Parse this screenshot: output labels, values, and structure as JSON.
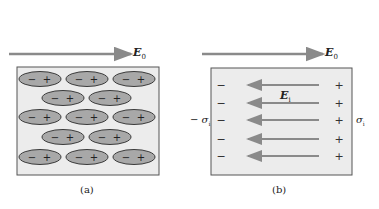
{
  "panel_a": {
    "caption": "(a)",
    "field_label": "E",
    "field_sub": "0",
    "dipole_neg": "−",
    "dipole_pos": "+",
    "rows": [
      3,
      2,
      3,
      2,
      3
    ]
  },
  "panel_b": {
    "caption": "(b)",
    "field_label": "E",
    "field_sub": "0",
    "internal_field_label": "E",
    "internal_field_sub": "i",
    "left_charge_label": "− σ",
    "left_charge_sub": "i",
    "right_charge_label": "σ",
    "right_charge_sub": "i",
    "neg_sign": "−",
    "pos_sign": "+",
    "arrow_count": 5
  },
  "colors": {
    "arrow": "#8a8a8a",
    "box_fill": "#ececec",
    "box_stroke": "#555555",
    "ellipse_fill": "#a8a8a8",
    "ellipse_stroke": "#3a3a3a",
    "text": "#222222"
  }
}
